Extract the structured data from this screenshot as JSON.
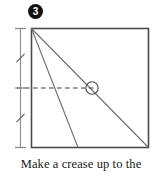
{
  "figure": {
    "step_number": "3",
    "caption": "Make a crease up to the",
    "colors": {
      "outline": "#4a4a4a",
      "fold_line": "#6e6e6e",
      "dashed_line": "#3d3d3d",
      "measure_line": "#8a8a8a",
      "badge_fill": "#111111",
      "badge_text": "#ffffff",
      "caption_text": "#1a1a1a",
      "paper_fill": "#ffffff"
    }
  },
  "diagram": {
    "paper": {
      "shape": "square",
      "x": 31,
      "y": 28,
      "width": 118,
      "height": 120
    },
    "fold_lines": [
      {
        "name": "corner-to-corner-diagonal",
        "style": "solid",
        "x1": 31,
        "y1": 28,
        "x2": 149,
        "y2": 148
      },
      {
        "name": "corner-to-bottom-edge-crease",
        "style": "solid",
        "x1": 31,
        "y1": 28,
        "x2": 78,
        "y2": 148
      }
    ],
    "dashed_line": {
      "name": "horizontal-midline",
      "style": "dashed",
      "x1": 17,
      "y1": 88,
      "x2": 95,
      "y2": 88
    },
    "intersection_marker": {
      "name": "crease-intersection-circle",
      "cx": 92,
      "cy": 88,
      "r": 6
    },
    "measure_bracket": {
      "name": "left-measurement-bracket",
      "x": 20,
      "y_top": 28,
      "y_bottom": 148,
      "ticks": [
        "top",
        "middle",
        "bottom"
      ],
      "hash_marks": [
        58,
        118
      ],
      "label": ""
    }
  }
}
